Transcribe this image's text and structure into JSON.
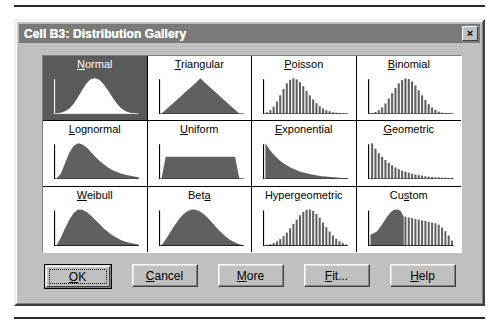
{
  "window": {
    "title": "Cell B3: Distribution Gallery",
    "close_label": "×",
    "close_icon": "close-icon",
    "titlebar_color": "#7a7a7a",
    "face_color": "#c0c0c0",
    "selected_color": "#5a5a5a"
  },
  "gallery": {
    "columns": 4,
    "rows": 3,
    "selected_index": 0,
    "cells": [
      {
        "label": "Normal",
        "accel": "N",
        "accel_index": 0,
        "shape": "bell",
        "selected": true
      },
      {
        "label": "Triangular",
        "accel": "T",
        "accel_index": 0,
        "shape": "triangle",
        "selected": false
      },
      {
        "label": "Poisson",
        "accel": "P",
        "accel_index": 0,
        "shape": "bars-skew",
        "selected": false
      },
      {
        "label": "Binomial",
        "accel": "B",
        "accel_index": 0,
        "shape": "bars-bell",
        "selected": false
      },
      {
        "label": "Lognormal",
        "accel": "L",
        "accel_index": 0,
        "shape": "lognormal",
        "selected": false
      },
      {
        "label": "Uniform",
        "accel": "U",
        "accel_index": 0,
        "shape": "uniform",
        "selected": false
      },
      {
        "label": "Exponential",
        "accel": "E",
        "accel_index": 0,
        "shape": "exponential",
        "selected": false
      },
      {
        "label": "Geometric",
        "accel": "G",
        "accel_index": 0,
        "shape": "bars-decay",
        "selected": false
      },
      {
        "label": "Weibull",
        "accel": "W",
        "accel_index": 0,
        "shape": "weibull",
        "selected": false
      },
      {
        "label": "Beta",
        "accel": "t",
        "accel_index": 3,
        "shape": "beta",
        "selected": false
      },
      {
        "label": "Hypergeometric",
        "accel": "g",
        "accel_index": 5,
        "shape": "bars-bell-wide",
        "selected": false
      },
      {
        "label": "Custom",
        "accel": "s",
        "accel_index": 2,
        "shape": "custom",
        "selected": false
      }
    ]
  },
  "buttons": [
    {
      "label": "OK",
      "accel": "O",
      "accel_index": 0,
      "default": true,
      "name": "ok-button"
    },
    {
      "label": "Cancel",
      "accel": "C",
      "accel_index": 0,
      "default": false,
      "name": "cancel-button"
    },
    {
      "label": "More",
      "accel": "M",
      "accel_index": 0,
      "default": false,
      "name": "more-button"
    },
    {
      "label": "Fit...",
      "accel": "F",
      "accel_index": 0,
      "default": false,
      "name": "fit-button"
    },
    {
      "label": "Help",
      "accel": "H",
      "accel_index": 0,
      "default": false,
      "name": "help-button"
    }
  ],
  "chart_data": {
    "type": "bar",
    "xlabel": "",
    "ylabel": "",
    "series": [
      {
        "name": "Normal",
        "render": "curve",
        "values": [
          0.01,
          0.03,
          0.07,
          0.15,
          0.28,
          0.47,
          0.68,
          0.87,
          0.98,
          1.0,
          0.95,
          0.82,
          0.64,
          0.45,
          0.28,
          0.15,
          0.07,
          0.03,
          0.01,
          0.0
        ]
      },
      {
        "name": "Triangular",
        "render": "curve",
        "values": [
          0.0,
          0.11,
          0.22,
          0.33,
          0.44,
          0.55,
          0.66,
          0.77,
          0.88,
          1.0,
          0.88,
          0.77,
          0.66,
          0.55,
          0.44,
          0.33,
          0.22,
          0.11,
          0.0,
          0.0
        ]
      },
      {
        "name": "Poisson",
        "render": "bars",
        "values": [
          0.04,
          0.1,
          0.2,
          0.34,
          0.52,
          0.7,
          0.86,
          0.96,
          1.0,
          0.97,
          0.89,
          0.78,
          0.65,
          0.52,
          0.4,
          0.3,
          0.21,
          0.15,
          0.1,
          0.07,
          0.04,
          0.03,
          0.02,
          0.01,
          0.01
        ]
      },
      {
        "name": "Binomial",
        "render": "bars",
        "values": [
          0.02,
          0.05,
          0.1,
          0.18,
          0.29,
          0.43,
          0.58,
          0.73,
          0.86,
          0.95,
          1.0,
          0.98,
          0.91,
          0.8,
          0.66,
          0.52,
          0.39,
          0.27,
          0.18,
          0.11,
          0.06,
          0.03,
          0.02,
          0.01,
          0.0
        ]
      },
      {
        "name": "Lognormal",
        "render": "curve",
        "values": [
          0.0,
          0.14,
          0.44,
          0.74,
          0.93,
          1.0,
          0.97,
          0.88,
          0.75,
          0.62,
          0.5,
          0.4,
          0.31,
          0.24,
          0.19,
          0.14,
          0.11,
          0.08,
          0.06,
          0.04
        ]
      },
      {
        "name": "Uniform",
        "render": "curve",
        "values": [
          0.0,
          0.62,
          0.62,
          0.62,
          0.62,
          0.62,
          0.62,
          0.62,
          0.62,
          0.62,
          0.62,
          0.62,
          0.62,
          0.62,
          0.62,
          0.62,
          0.62,
          0.62,
          0.0,
          0.0
        ]
      },
      {
        "name": "Exponential",
        "render": "curve",
        "values": [
          1.0,
          0.82,
          0.67,
          0.55,
          0.45,
          0.37,
          0.3,
          0.25,
          0.2,
          0.17,
          0.14,
          0.11,
          0.09,
          0.07,
          0.06,
          0.05,
          0.04,
          0.03,
          0.02,
          0.02
        ]
      },
      {
        "name": "Geometric",
        "render": "bars",
        "values": [
          1.0,
          0.85,
          0.72,
          0.62,
          0.53,
          0.45,
          0.38,
          0.32,
          0.27,
          0.23,
          0.2,
          0.17,
          0.14,
          0.12,
          0.1,
          0.09,
          0.07,
          0.06,
          0.05,
          0.04,
          0.04,
          0.03,
          0.03,
          0.02,
          0.02
        ]
      },
      {
        "name": "Weibull",
        "render": "curve",
        "values": [
          0.0,
          0.22,
          0.48,
          0.72,
          0.9,
          1.0,
          0.99,
          0.93,
          0.83,
          0.71,
          0.59,
          0.47,
          0.37,
          0.28,
          0.21,
          0.15,
          0.11,
          0.07,
          0.05,
          0.03
        ]
      },
      {
        "name": "Beta",
        "render": "curve",
        "values": [
          0.0,
          0.17,
          0.36,
          0.55,
          0.72,
          0.86,
          0.95,
          1.0,
          0.99,
          0.94,
          0.85,
          0.73,
          0.6,
          0.46,
          0.34,
          0.23,
          0.15,
          0.09,
          0.04,
          0.01
        ]
      },
      {
        "name": "Hypergeometric",
        "render": "bars",
        "values": [
          0.02,
          0.04,
          0.07,
          0.12,
          0.18,
          0.26,
          0.36,
          0.48,
          0.6,
          0.72,
          0.84,
          0.93,
          0.99,
          1.0,
          0.96,
          0.88,
          0.77,
          0.64,
          0.51,
          0.39,
          0.28,
          0.19,
          0.12,
          0.07,
          0.03
        ]
      },
      {
        "name": "Custom",
        "render": "custom",
        "values": [
          0.3,
          0.34,
          0.4,
          0.52,
          0.66,
          0.8,
          0.92,
          0.99,
          1.0,
          0.97,
          0.8,
          0.78,
          0.76,
          0.74,
          0.72,
          0.7,
          0.68,
          0.66,
          0.64,
          0.62,
          0.58,
          0.5,
          0.4,
          0.28,
          0.14
        ]
      }
    ]
  }
}
